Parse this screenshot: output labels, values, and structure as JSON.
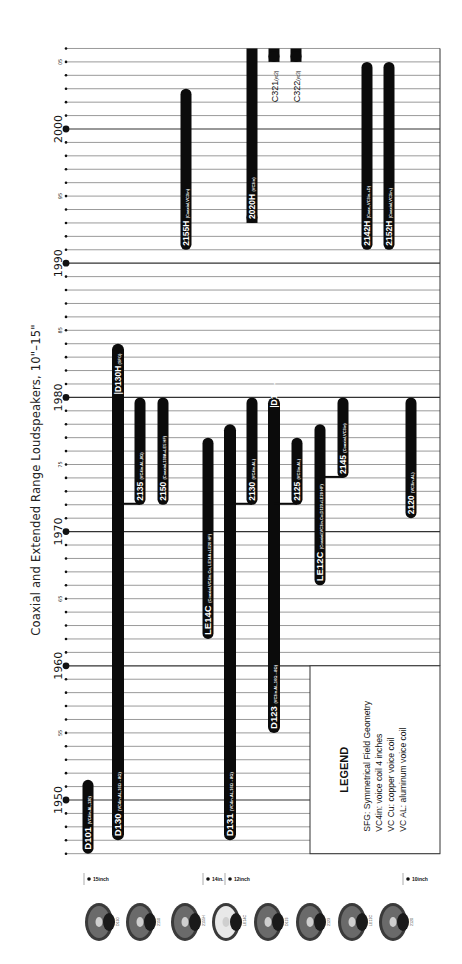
{
  "chart_data": {
    "type": "timeline",
    "orientation": "rotated-90-ccw",
    "title": "Coaxial and Extended Range Loudspeakers, 10\"–15\"",
    "axis": {
      "label": "Year",
      "range": [
        1946,
        2006
      ],
      "major_ticks": [
        1950,
        1960,
        1970,
        1980,
        1990,
        2000
      ],
      "minor_tick_labels": [
        "55",
        "65",
        "75",
        "85",
        "95",
        "05"
      ],
      "grid": true
    },
    "size_groups": [
      {
        "label": "15inch",
        "models": [
          "D101",
          "D130",
          "2135",
          "2150",
          "2155H"
        ]
      },
      {
        "label": "14in.",
        "models": [
          "LE14C"
        ]
      },
      {
        "label": "12inch",
        "models": [
          "D131",
          "2130",
          "2020H",
          "D123",
          "C321",
          "2125",
          "C322",
          "LE12C",
          "2145",
          "2142H",
          "2152H"
        ]
      },
      {
        "label": "10inch",
        "models": [
          "2120"
        ]
      }
    ],
    "series": [
      {
        "name": "D101",
        "note": "VC4in.AL,120",
        "start": 1946,
        "end": 1951.5
      },
      {
        "name": "D130",
        "note": "VC4in.AL,16Ω→8Ω",
        "start": 1947,
        "end": 1984,
        "variant": {
          "name": "D130H",
          "note": "SFG",
          "start": 1980,
          "end": 1984
        }
      },
      {
        "name": "2135",
        "note": "VC4in.AL,8Ω",
        "start": 1972,
        "end": 1980,
        "branch_from": "D130"
      },
      {
        "name": "2150",
        "note": "Coaxial,130A+LE5 HF",
        "start": 1972,
        "end": 1980
      },
      {
        "name": "2155H",
        "note": "Coaxial,VC3in",
        "start": 1991,
        "end": 2003
      },
      {
        "name": "LE14C",
        "note": "Coaxial,VC4in.Cu, LE14A+LE20 HF",
        "start": 1962,
        "end": 1977
      },
      {
        "name": "D131",
        "note": "VC4in.AL,16Ω→8Ω",
        "start": 1947,
        "end": 1978
      },
      {
        "name": "2130",
        "note": "VC4in.AL",
        "start": 1972,
        "end": 1980,
        "branch_from": "D131"
      },
      {
        "name": "2020H",
        "note": "VC3in",
        "start": 1993,
        "end": 2006
      },
      {
        "name": "D123",
        "note": "VC3in.AL,16Ω→8Ω",
        "start": 1955,
        "end": 1980,
        "variant": {
          "name": "D123-3",
          "note": "",
          "start": 1979,
          "end": 1980
        }
      },
      {
        "name": "C321",
        "note": "vc2",
        "start": 2005,
        "end": 2006
      },
      {
        "name": "2125",
        "note": "VC3in.AL",
        "start": 1972,
        "end": 1977,
        "branch_from": "D123"
      },
      {
        "name": "C322",
        "note": "vc3",
        "start": 2005,
        "end": 2006
      },
      {
        "name": "LE12C",
        "note": "Coaxial,VC3in.Cu,D123+LE20 HF",
        "start": 1966,
        "end": 1978
      },
      {
        "name": "2145",
        "note": "Coaxial,VC3in",
        "start": 1974,
        "end": 1980,
        "branch_from": "LE12C"
      },
      {
        "name": "2142H",
        "note": "Coax.,VC3in.+D",
        "start": 1991,
        "end": 2005
      },
      {
        "name": "2152H",
        "note": "Coaxial,VC3in.",
        "start": 1991,
        "end": 2005
      },
      {
        "name": "2120",
        "note": "VC3in.AL",
        "start": 1971,
        "end": 1980
      }
    ],
    "legend": {
      "title": "LEGEND",
      "items": [
        "SFG: Symmetrical Field Geometry",
        "VC4in: voice coil 4 inches",
        "VC Cu: copper voice coil",
        "VC AL: aluminum voice coil"
      ]
    },
    "photos": [
      "D130",
      "2150",
      "2155H",
      "LE14C",
      "D123",
      "2123",
      "LE12C",
      "2120"
    ]
  }
}
